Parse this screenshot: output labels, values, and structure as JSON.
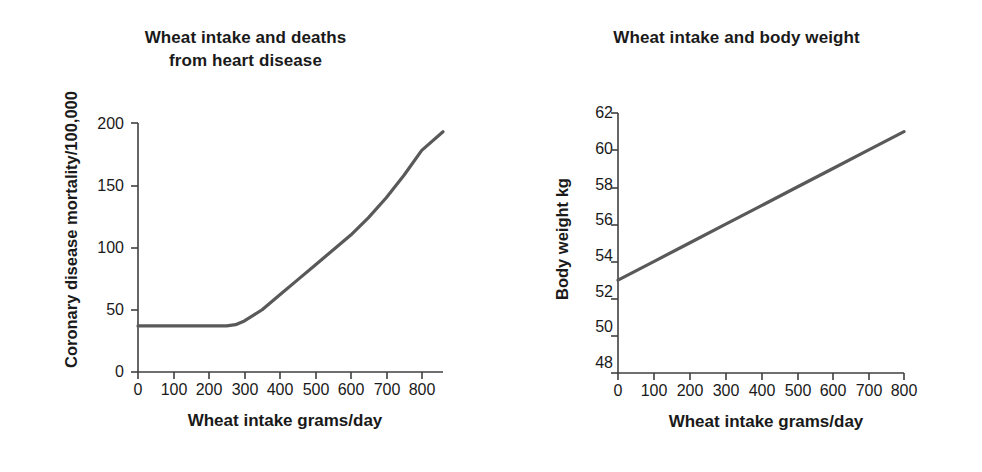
{
  "figure": {
    "background_color": "#ffffff",
    "series_color": "#595959",
    "axis_color": "#3f3f3f",
    "text_color": "#1a1a1a"
  },
  "panels": [
    {
      "id": "coronary-disease",
      "title_lines": [
        "Wheat intake and deaths",
        "from heart disease"
      ],
      "ylabel": "Coronary disease mortality/100,000",
      "xlabel": "Wheat intake grams/day",
      "yticks": [
        "0",
        "50",
        "100",
        "150",
        "200"
      ],
      "xticks": [
        "0",
        "100",
        "200",
        "300",
        "400",
        "500",
        "600",
        "700",
        "800"
      ]
    },
    {
      "id": "body-weight",
      "title_lines": [
        "Wheat intake and body weight"
      ],
      "ylabel": "Body weight kg",
      "xlabel": "Wheat intake grams/day",
      "yticks": [
        "48",
        "50",
        "52",
        "54",
        "56",
        "58",
        "60",
        "62"
      ],
      "xticks": [
        "0",
        "100",
        "200",
        "300",
        "400",
        "500",
        "600",
        "700",
        "800"
      ]
    }
  ],
  "chart_data": [
    {
      "type": "line",
      "id": "coronary-disease",
      "title": "Wheat intake and deaths from heart disease",
      "xlabel": "Wheat intake grams/day",
      "ylabel": "Coronary disease mortality/100,000",
      "xlim": [
        0,
        860
      ],
      "ylim": [
        0,
        200
      ],
      "xticks": [
        0,
        100,
        200,
        300,
        400,
        500,
        600,
        700,
        800
      ],
      "yticks": [
        0,
        50,
        100,
        150,
        200
      ],
      "grid": false,
      "legend": null,
      "series": [
        {
          "name": "Coronary disease mortality",
          "x": [
            0,
            50,
            100,
            150,
            200,
            250,
            275,
            300,
            350,
            400,
            450,
            500,
            550,
            600,
            650,
            700,
            750,
            800,
            860
          ],
          "y": [
            37,
            37,
            37,
            37,
            37,
            37,
            38,
            41,
            50,
            62,
            74,
            86,
            98,
            110,
            124,
            140,
            158,
            178,
            193
          ]
        }
      ]
    },
    {
      "type": "line",
      "id": "body-weight",
      "title": "Wheat intake and body weight",
      "xlabel": "Wheat intake grams/day",
      "ylabel": "Body weight kg",
      "xlim": [
        0,
        800
      ],
      "ylim": [
        48,
        62
      ],
      "xticks": [
        0,
        100,
        200,
        300,
        400,
        500,
        600,
        700,
        800
      ],
      "yticks": [
        48,
        50,
        52,
        54,
        56,
        58,
        60,
        62
      ],
      "grid": false,
      "legend": null,
      "series": [
        {
          "name": "Body weight",
          "x": [
            0,
            100,
            200,
            300,
            400,
            500,
            600,
            700,
            800
          ],
          "y": [
            53.0,
            54.0,
            55.0,
            56.0,
            57.0,
            58.0,
            59.0,
            60.0,
            61.0
          ]
        }
      ]
    }
  ]
}
